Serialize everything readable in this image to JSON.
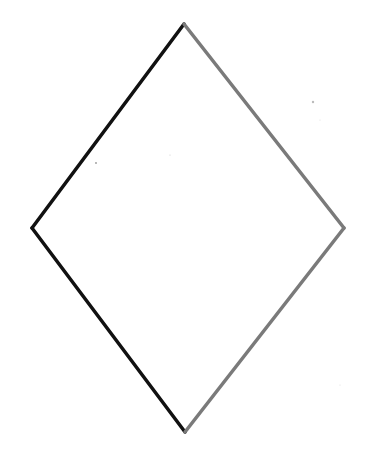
{
  "shape": {
    "type": "rhombus",
    "vertices": {
      "top": [
        184,
        24
      ],
      "right": [
        344,
        228
      ],
      "bottom": [
        185,
        432
      ],
      "left": [
        32,
        228
      ]
    },
    "stroke_width": 3.5,
    "colors": {
      "left_edges": "#111111",
      "right_edges": "#7a7a7a",
      "fill": "#ffffff",
      "background": "#ffffff"
    }
  },
  "specks": [
    {
      "x": 313,
      "y": 102,
      "r": 1.2,
      "color": "#bbbbbb"
    },
    {
      "x": 96,
      "y": 163,
      "r": 0.9,
      "color": "#999999"
    },
    {
      "x": 170,
      "y": 155,
      "r": 0.6,
      "color": "#cccccc"
    },
    {
      "x": 320,
      "y": 120,
      "r": 0.6,
      "color": "#dddddd"
    },
    {
      "x": 340,
      "y": 385,
      "r": 0.6,
      "color": "#dddddd"
    }
  ]
}
